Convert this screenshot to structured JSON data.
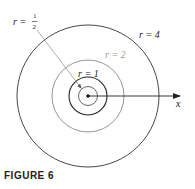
{
  "figure": {
    "caption": "FIGURE 6",
    "axis_label": "x",
    "center": {
      "x": 88,
      "y": 96
    },
    "circles": [
      {
        "label_r": "r =",
        "label_value": "½",
        "value": 0.5,
        "radius_px": 10,
        "color": "#555555",
        "label_color": "#222222"
      },
      {
        "label": "r = 1",
        "value": 1,
        "radius_px": 19,
        "color": "#222222",
        "label_color": "#222222"
      },
      {
        "label": "r = 2",
        "value": 2,
        "radius_px": 36,
        "color": "#8a8a8a",
        "label_color": "#9a9a9a"
      },
      {
        "label": "r = 4",
        "value": 4,
        "radius_px": 71,
        "color": "#333333",
        "label_color": "#222222"
      }
    ],
    "half_label": {
      "prefix": "r =",
      "numerator": "1",
      "denominator": "2"
    },
    "colors": {
      "dark": "#222222",
      "gray": "#8a8a8a",
      "leader": "#999999"
    }
  }
}
